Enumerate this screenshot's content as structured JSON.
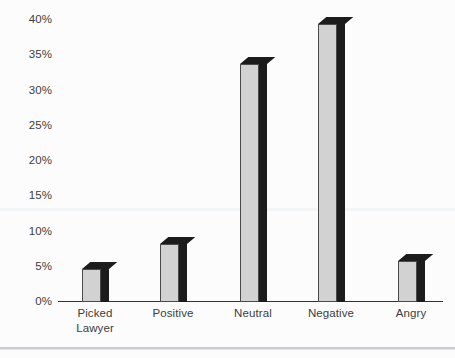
{
  "chart_data": {
    "type": "bar",
    "title": "",
    "subtitle": "",
    "xlabel": "",
    "ylabel": "",
    "categories": [
      "Picked Lawyer",
      "Positive",
      "Neutral",
      "Negative",
      "Angry"
    ],
    "category_lines": [
      [
        "Picked",
        "Lawyer"
      ],
      [
        "Positive"
      ],
      [
        "Neutral"
      ],
      [
        "Negative"
      ],
      [
        "Angry"
      ]
    ],
    "values": [
      4.7,
      8.2,
      33.7,
      39.5,
      5.8
    ],
    "value_labels": [
      "",
      "",
      "",
      "",
      ""
    ],
    "ylim": [
      0,
      40
    ],
    "ytick_values": [
      0,
      5,
      10,
      15,
      20,
      25,
      30,
      35,
      40
    ],
    "ytick_labels": [
      "0%",
      "5%",
      "10%",
      "15%",
      "20%",
      "25%",
      "30%",
      "35%",
      "40%"
    ],
    "grid": false,
    "legend": null,
    "legend_position": "none",
    "series": [
      {
        "name": "Percentage of responses",
        "values": [
          4.7,
          8.2,
          33.7,
          39.5,
          5.8
        ]
      }
    ],
    "colors": {
      "bar_face": "#d2d2d2",
      "bar_outline": "#4a4a4a",
      "bar_shadow": "#1c1c1c",
      "axis": "#333333",
      "text": "#3c3c3c",
      "background": "#fcfcfc",
      "footer_rule": "#c9ccd1"
    }
  }
}
